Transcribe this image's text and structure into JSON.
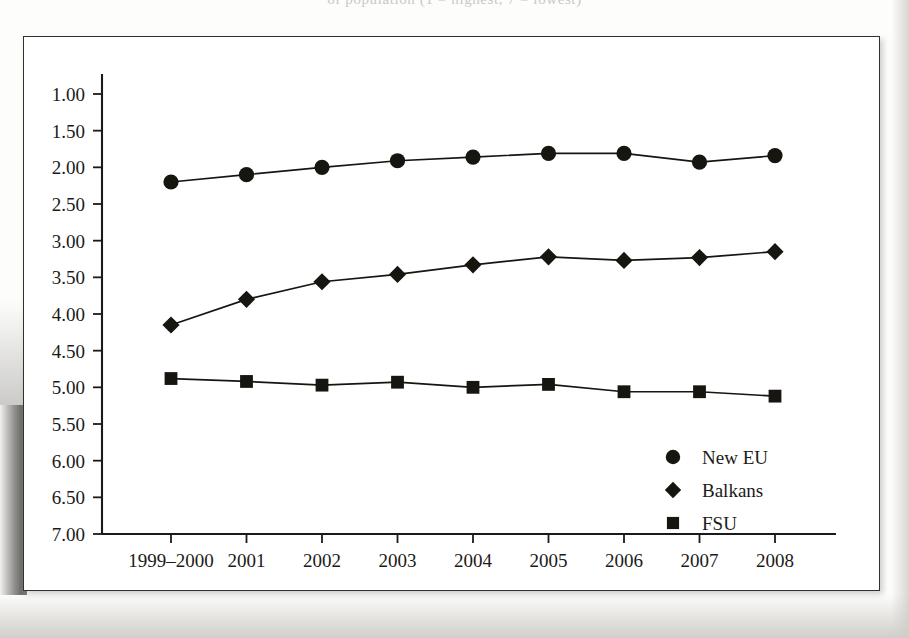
{
  "scan": {
    "top_text_fragment": "of population (1 = highest, 7 = lowest)"
  },
  "chart_data": {
    "type": "line",
    "title": "",
    "subtitle": "",
    "xlabel": "",
    "ylabel": "",
    "categories": [
      "1999–2000",
      "2001",
      "2002",
      "2003",
      "2004",
      "2005",
      "2006",
      "2007",
      "2008"
    ],
    "series": [
      {
        "name": "New EU",
        "marker": "circle",
        "color": "#17150f",
        "values": [
          2.2,
          2.1,
          2.0,
          1.91,
          1.86,
          1.81,
          1.81,
          1.93,
          1.84
        ]
      },
      {
        "name": "Balkans",
        "marker": "diamond",
        "color": "#17150f",
        "values": [
          4.15,
          3.8,
          3.56,
          3.46,
          3.33,
          3.22,
          3.27,
          3.23,
          3.15
        ]
      },
      {
        "name": "FSU",
        "marker": "square",
        "color": "#17150f",
        "values": [
          4.88,
          4.92,
          4.97,
          4.93,
          5.0,
          4.96,
          5.06,
          5.06,
          5.12
        ]
      }
    ],
    "y_ticks": [
      "1.00",
      "1.50",
      "2.00",
      "2.50",
      "3.00",
      "3.50",
      "4.00",
      "4.50",
      "5.00",
      "5.50",
      "6.00",
      "6.50",
      "7.00"
    ],
    "y_tick_values": [
      1.0,
      1.5,
      2.0,
      2.5,
      3.0,
      3.5,
      4.0,
      4.5,
      5.0,
      5.5,
      6.0,
      6.5,
      7.0
    ],
    "ylim": [
      1.0,
      7.0
    ],
    "y_axis_inverted": true,
    "grid": false,
    "legend_position": "inside-bottom-right",
    "legend": [
      "New EU",
      "Balkans",
      "FSU"
    ]
  }
}
